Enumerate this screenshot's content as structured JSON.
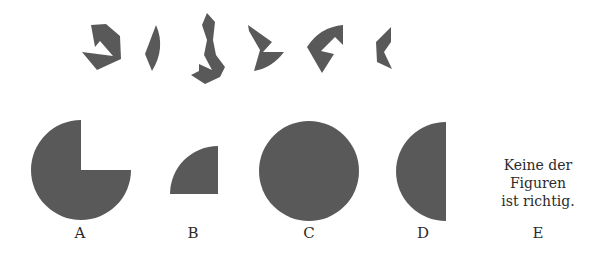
{
  "colors": {
    "shape_fill": "#595959",
    "text": "#2b2b2b",
    "background": "#ffffff"
  },
  "pieces": [
    {
      "name": "piece-1",
      "points": "91,25 106,24 120,36 121,59 97,70 82,52 113,56 100,41 95,47"
    },
    {
      "name": "piece-2",
      "path": "M156,25 Q166,48 152,71 L145,54 Z"
    },
    {
      "name": "piece-3",
      "points": "207,13 215,22 213,40 216,55 225,67 220,77 205,84 191,75 199,71 199,64 212,70 204,55 207,40 202,25"
    },
    {
      "name": "piece-4",
      "path": "M248,25 L272,42 L263,52 L284,52 Q272,68 254,71 L260,50 L249,31 Z"
    },
    {
      "name": "piece-5",
      "path": "M343,25 L343,45 L335,37 L321,51 L334,54 L322,73 L307,47 Q320,27 343,25 Z"
    },
    {
      "name": "piece-6",
      "points": "391,27 391,42 384,52 392,69 377,62 376,42"
    }
  ],
  "options": [
    {
      "letter": "A",
      "label_x": 80,
      "description": "three-quarter circle (top-right quadrant missing)"
    },
    {
      "letter": "B",
      "label_x": 193,
      "description": "quarter circle"
    },
    {
      "letter": "C",
      "label_x": 309,
      "description": "full circle"
    },
    {
      "letter": "D",
      "label_x": 423,
      "description": "half circle (left half)"
    },
    {
      "letter": "E",
      "label_x": 538,
      "description": "text option"
    }
  ],
  "option_e_text": [
    "Keine der",
    "Figuren",
    "ist richtig."
  ]
}
